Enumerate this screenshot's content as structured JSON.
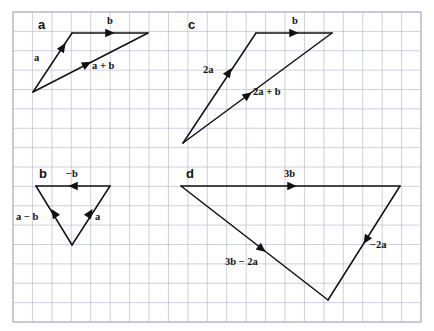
{
  "figure": {
    "width": 434,
    "height": 331,
    "background_color": "#ffffff",
    "ink_color": "#111111"
  },
  "grid": {
    "line_color": "#b9bcd0",
    "border_color": "#a9acc2",
    "x_start": 13,
    "y_start": 12,
    "x_end": 421,
    "y_end": 322,
    "cell_width": 19.43,
    "cell_height": 19.375,
    "cols": 21,
    "rows": 16
  },
  "panels": [
    {
      "id": "a",
      "letter": "a",
      "letter_pos": {
        "x": 38,
        "y": 29
      },
      "vectors": [
        {
          "name": "a",
          "label": "a",
          "label_pos": {
            "x": 34,
            "y": 61
          },
          "from": {
            "x": 33,
            "y": 92
          },
          "to": {
            "x": 72,
            "y": 33
          },
          "arrow_at": {
            "x": 63,
            "y": 47
          }
        },
        {
          "name": "b",
          "label": "b",
          "label_pos": {
            "x": 107,
            "y": 24
          },
          "from": {
            "x": 72,
            "y": 33
          },
          "to": {
            "x": 148,
            "y": 33
          },
          "arrow_at": {
            "x": 110,
            "y": 33
          }
        },
        {
          "name": "a-plus-b",
          "label": "a + b",
          "label_pos": {
            "x": 92,
            "y": 69
          },
          "from": {
            "x": 33,
            "y": 92
          },
          "to": {
            "x": 148,
            "y": 33
          },
          "arrow_at": {
            "x": 87,
            "y": 64
          }
        }
      ]
    },
    {
      "id": "b",
      "letter": "b",
      "letter_pos": {
        "x": 39,
        "y": 178
      },
      "vectors": [
        {
          "name": "minus-b",
          "label": "−b",
          "label_pos": {
            "x": 66,
            "y": 177
          },
          "from": {
            "x": 110,
            "y": 186
          },
          "to": {
            "x": 36,
            "y": 186
          },
          "arrow_at": {
            "x": 73,
            "y": 186
          }
        },
        {
          "name": "a",
          "label": "a",
          "label_pos": {
            "x": 95,
            "y": 220
          },
          "from": {
            "x": 72,
            "y": 245
          },
          "to": {
            "x": 110,
            "y": 186
          },
          "arrow_at": {
            "x": 90,
            "y": 213
          }
        },
        {
          "name": "a-minus-b",
          "label": "a − b",
          "label_pos": {
            "x": 16,
            "y": 220
          },
          "from": {
            "x": 72,
            "y": 245
          },
          "to": {
            "x": 36,
            "y": 186
          },
          "arrow_at": {
            "x": 54,
            "y": 213
          }
        }
      ]
    },
    {
      "id": "c",
      "letter": "c",
      "letter_pos": {
        "x": 188,
        "y": 29
      },
      "vectors": [
        {
          "name": "2a",
          "label": "2a",
          "label_pos": {
            "x": 203,
            "y": 73
          },
          "from": {
            "x": 183,
            "y": 143
          },
          "to": {
            "x": 256,
            "y": 33
          },
          "arrow_at": {
            "x": 229,
            "y": 72
          }
        },
        {
          "name": "b",
          "label": "b",
          "label_pos": {
            "x": 292,
            "y": 24
          },
          "from": {
            "x": 256,
            "y": 33
          },
          "to": {
            "x": 332,
            "y": 33
          },
          "arrow_at": {
            "x": 294,
            "y": 33
          }
        },
        {
          "name": "2a-plus-b",
          "label": "2a + b",
          "label_pos": {
            "x": 253,
            "y": 95
          },
          "from": {
            "x": 183,
            "y": 143
          },
          "to": {
            "x": 332,
            "y": 33
          },
          "arrow_at": {
            "x": 248,
            "y": 95
          }
        }
      ]
    },
    {
      "id": "d",
      "letter": "d",
      "letter_pos": {
        "x": 186,
        "y": 178
      },
      "vectors": [
        {
          "name": "3b",
          "label": "3b",
          "label_pos": {
            "x": 284,
            "y": 177
          },
          "from": {
            "x": 181,
            "y": 186
          },
          "to": {
            "x": 400,
            "y": 186
          },
          "arrow_at": {
            "x": 292,
            "y": 186
          }
        },
        {
          "name": "minus-2a",
          "label": "−2a",
          "label_pos": {
            "x": 370,
            "y": 248
          },
          "from": {
            "x": 400,
            "y": 186
          },
          "to": {
            "x": 328,
            "y": 300
          },
          "arrow_at": {
            "x": 366,
            "y": 240
          }
        },
        {
          "name": "3b-minus-2a",
          "label": "3b − 2a",
          "label_pos": {
            "x": 225,
            "y": 265
          },
          "from": {
            "x": 181,
            "y": 186
          },
          "to": {
            "x": 328,
            "y": 300
          },
          "arrow_at": {
            "x": 262,
            "y": 249
          }
        }
      ]
    }
  ]
}
